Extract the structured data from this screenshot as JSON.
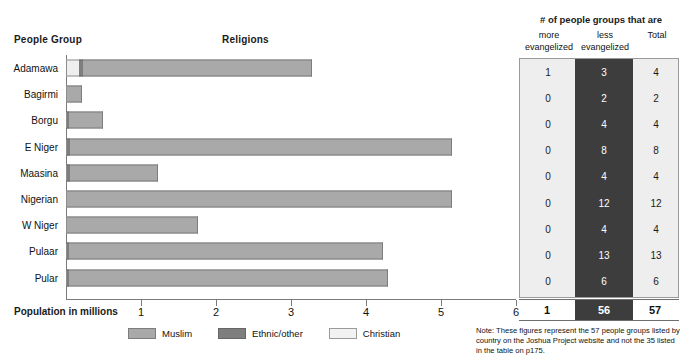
{
  "headers": {
    "people_group": "People Group",
    "religions": "Religions",
    "axis_title": "Population in millions"
  },
  "legend": [
    {
      "label": "Muslim",
      "color": "#a9a9a9",
      "icon": "legend-swatch-muslim"
    },
    {
      "label": "Ethnic/other",
      "color": "#7e7e7e",
      "icon": "legend-swatch-ethnic"
    },
    {
      "label": "Christian",
      "color": "#f2f2f2",
      "icon": "legend-swatch-christian"
    }
  ],
  "table": {
    "title": "# of people groups that are",
    "columns": [
      "more evangelized",
      "less evangelized",
      "Total"
    ],
    "col_more_line1": "more",
    "col_more_line2": "evangelized",
    "col_less_line1": "less",
    "col_less_line2": "evangelized",
    "col_total": "Total",
    "rows": [
      {
        "group": "Adamawa",
        "more": "1",
        "less": "3",
        "total": "4"
      },
      {
        "group": "Bagirmi",
        "more": "0",
        "less": "2",
        "total": "2"
      },
      {
        "group": "Borgu",
        "more": "0",
        "less": "4",
        "total": "4"
      },
      {
        "group": "E Niger",
        "more": "0",
        "less": "8",
        "total": "8"
      },
      {
        "group": "Maasina",
        "more": "0",
        "less": "4",
        "total": "4"
      },
      {
        "group": "Nigerian",
        "more": "0",
        "less": "12",
        "total": "12"
      },
      {
        "group": "W Niger",
        "more": "0",
        "less": "4",
        "total": "4"
      },
      {
        "group": "Pulaar",
        "more": "0",
        "less": "13",
        "total": "13"
      },
      {
        "group": "Pular",
        "more": "0",
        "less": "6",
        "total": "6"
      }
    ],
    "totals": {
      "more": "1",
      "less": "56",
      "total": "57"
    }
  },
  "note": "Note: These figures represent the 57 people groups listed by country on the Joshua Project website and not the 35 listed in the table on p175.",
  "chart_data": {
    "type": "bar",
    "orientation": "horizontal",
    "stacked": true,
    "title": "Religions",
    "xlabel": "Population in millions",
    "ylabel": "People Group",
    "xlim": [
      0,
      6
    ],
    "xticks": [
      0,
      1,
      2,
      3,
      4,
      5,
      6
    ],
    "xticklabels": [
      "",
      "1",
      "2",
      "3",
      "4",
      "5",
      "6"
    ],
    "grid": false,
    "legend_position": "bottom",
    "categories": [
      "Adamawa",
      "Bagirmi",
      "Borgu",
      "E Niger",
      "Maasina",
      "Nigerian",
      "W Niger",
      "Pulaar",
      "Pular"
    ],
    "series": [
      {
        "name": "Christian",
        "color": "#efefef",
        "values": [
          0.17,
          0.0,
          0.0,
          0.0,
          0.0,
          0.0,
          0.0,
          0.0,
          0.0
        ]
      },
      {
        "name": "Ethnic/other",
        "color": "#7e7e7e",
        "values": [
          0.06,
          0.0,
          0.04,
          0.05,
          0.05,
          0.0,
          0.0,
          0.04,
          0.04
        ]
      },
      {
        "name": "Muslim",
        "color": "#a9a9a9",
        "values": [
          3.05,
          0.21,
          0.45,
          5.1,
          1.18,
          5.15,
          1.76,
          4.19,
          4.25
        ]
      }
    ],
    "totals": [
      3.28,
      0.21,
      0.49,
      5.15,
      1.23,
      5.15,
      1.76,
      4.23,
      4.29
    ]
  }
}
